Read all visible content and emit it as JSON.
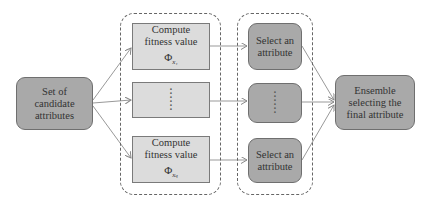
{
  "diagram": {
    "source": {
      "label_lines": [
        "Set of",
        "candidate",
        "attributes"
      ]
    },
    "fitness_group": {
      "items": [
        {
          "line1": "Compute",
          "line2": "fitness value",
          "symbol": "Φ",
          "subscript": "x₁"
        },
        {
          "ellipsis": "⋮"
        },
        {
          "line1": "Compute",
          "line2": "fitness value",
          "symbol": "Φ",
          "subscript": "x_q"
        }
      ]
    },
    "select_group": {
      "items": [
        {
          "line1": "Select an",
          "line2": "attribute"
        },
        {
          "ellipsis": "⋮"
        },
        {
          "line1": "Select an",
          "line2": "attribute"
        }
      ]
    },
    "sink": {
      "label_lines": [
        "Ensemble",
        "selecting the",
        "final attribute"
      ]
    },
    "colors": {
      "rounded_fill": "#a9a9a9",
      "rect_fill": "#dcdcdc",
      "edge": "#888888",
      "dashed": "#666666"
    }
  }
}
